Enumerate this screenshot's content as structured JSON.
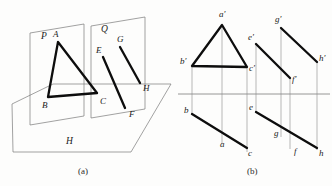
{
  "figure": {
    "captions": [
      {
        "id": "caption-a",
        "text": "(a)",
        "x": 78,
        "y": 174
      },
      {
        "id": "caption-b",
        "text": "(b)",
        "x": 247,
        "y": 174
      }
    ],
    "colors": {
      "thick_line": "#0d0d0d",
      "thin_line": "#7a7a7a",
      "axis_line": "#8a8a8a",
      "projector_line": "#9a9a9a",
      "label_text": "#1a1a1a",
      "background": "#fdfdfc"
    }
  },
  "panel_a": {
    "name": "pictorial-view",
    "planes": [
      {
        "id": "plane-P",
        "label": "P",
        "label_pos": {
          "x": 41,
          "y": 39
        },
        "outline": "30,33 84,24 84,116 30,125"
      },
      {
        "id": "plane-Q",
        "label": "Q",
        "label_pos": {
          "x": 101,
          "y": 32
        },
        "outline": "91,26 145,17 145,109 91,118"
      },
      {
        "id": "plane-H",
        "label": "H",
        "label_pos": {
          "x": 66,
          "y": 144
        },
        "outline": "12,104 53,84 171,84 131,152 13,152"
      }
    ],
    "triangle_ABC": {
      "id": "triangle-ABC",
      "points": "58,42 48,97 97,93",
      "vertices": [
        {
          "label": "A",
          "x": 53,
          "y": 37
        },
        {
          "label": "B",
          "x": 42,
          "y": 108
        },
        {
          "label": "C",
          "x": 100,
          "y": 104
        }
      ]
    },
    "segment_EF": {
      "id": "segment-EF",
      "from": {
        "x": 103,
        "y": 57
      },
      "to": {
        "x": 125,
        "y": 108
      },
      "endpoints": [
        {
          "label": "E",
          "x": 96,
          "y": 53
        },
        {
          "label": "F",
          "x": 129,
          "y": 117
        }
      ]
    },
    "segment_GH": {
      "id": "segment-GH",
      "from": {
        "x": 120,
        "y": 47
      },
      "to": {
        "x": 140,
        "y": 83
      },
      "endpoints": [
        {
          "label": "G",
          "x": 117,
          "y": 42
        },
        {
          "label": "H",
          "x": 143,
          "y": 91
        }
      ]
    }
  },
  "panel_b": {
    "name": "orthographic-view",
    "axis": {
      "id": "ground-line",
      "x1": 178,
      "y1": 94,
      "x2": 330,
      "y2": 94
    },
    "triangle_primed": {
      "id": "triangle-a-b-c-primed",
      "points": "222,25 192,66 247,67",
      "vertices": [
        {
          "label": "a′",
          "x": 219,
          "y": 17
        },
        {
          "label": "b′",
          "x": 182,
          "y": 64
        },
        {
          "label": "c′",
          "x": 250,
          "y": 70
        }
      ]
    },
    "segment_ef_primed": {
      "id": "segment-e-f-primed",
      "from": {
        "x": 256,
        "y": 44
      },
      "to": {
        "x": 290,
        "y": 78
      },
      "endpoints": [
        {
          "label": "e′",
          "x": 250,
          "y": 40
        },
        {
          "label": "f′",
          "x": 293,
          "y": 81
        }
      ]
    },
    "segment_gh_primed": {
      "id": "segment-g-h-primed",
      "from": {
        "x": 281,
        "y": 28
      },
      "to": {
        "x": 317,
        "y": 62
      },
      "endpoints": [
        {
          "label": "g′",
          "x": 276,
          "y": 22
        },
        {
          "label": "h′",
          "x": 320,
          "y": 60
        }
      ]
    },
    "segment_bc_plan": {
      "id": "segment-b-a-c-plan",
      "from": {
        "x": 192,
        "y": 114
      },
      "to": {
        "x": 247,
        "y": 148
      },
      "labels": [
        {
          "label": "b",
          "x": 185,
          "y": 113
        },
        {
          "label": "a",
          "x": 222,
          "y": 147
        },
        {
          "label": "c",
          "x": 250,
          "y": 155
        }
      ]
    },
    "segment_ef_plan": {
      "id": "segment-e-f-plan",
      "from": {
        "x": 256,
        "y": 112
      },
      "to": {
        "x": 317,
        "y": 148
      },
      "labels": [
        {
          "label": "e",
          "x": 250,
          "y": 110
        },
        {
          "label": "g",
          "x": 276,
          "y": 136
        },
        {
          "label": "f",
          "x": 296,
          "y": 153
        },
        {
          "label": "h",
          "x": 320,
          "y": 155
        }
      ]
    },
    "projectors": [
      {
        "id": "projector-b",
        "x": 192,
        "y1": 66,
        "y2": 114
      },
      {
        "id": "projector-a",
        "x": 222,
        "y1": 25,
        "y2": 144
      },
      {
        "id": "projector-c",
        "x": 247,
        "y1": 67,
        "y2": 152
      },
      {
        "id": "projector-e",
        "x": 256,
        "y1": 44,
        "y2": 113
      },
      {
        "id": "projector-g",
        "x": 281,
        "y1": 28,
        "y2": 137
      },
      {
        "id": "projector-f",
        "x": 290,
        "y1": 78,
        "y2": 149
      },
      {
        "id": "projector-h",
        "x": 317,
        "y1": 62,
        "y2": 150
      }
    ]
  }
}
